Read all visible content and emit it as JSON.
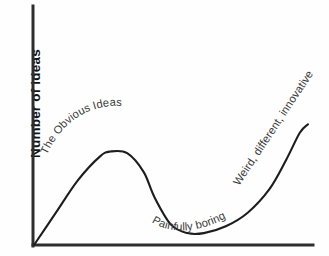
{
  "chart_data": {
    "type": "line",
    "title": "",
    "xlabel": "",
    "ylabel": "Number of Ideas",
    "grid": false,
    "legend_position": "none",
    "axis_style": "open (left and bottom spines only, no ticks, no tick labels)",
    "xlim": [
      0,
      1
    ],
    "ylim": [
      0,
      1
    ],
    "x_tick_labels": [],
    "y_tick_labels": [],
    "series": [
      {
        "name": "Idea quality curve",
        "description": "Rises steeply to an early peak of obvious ideas, collapses into a boring trough, then climbs exponentially into weird, different, innovative territory",
        "x": [
          0.0,
          0.08,
          0.16,
          0.24,
          0.28,
          0.34,
          0.4,
          0.44,
          0.5,
          0.56,
          0.62,
          0.7,
          0.78,
          0.86,
          0.92,
          0.97,
          1.0
        ],
        "y": [
          0.0,
          0.19,
          0.38,
          0.52,
          0.55,
          0.54,
          0.43,
          0.28,
          0.12,
          0.07,
          0.07,
          0.11,
          0.19,
          0.33,
          0.5,
          0.66,
          0.71
        ]
      }
    ],
    "annotations": [
      {
        "id": "peak-label",
        "text": "The Obvious Ideas",
        "placement": "along the outside of the first peak, arcing upward left to right",
        "approx_x": 0.2,
        "approx_y": 0.6
      },
      {
        "id": "trough-label",
        "text": "Painfully boring",
        "placement": "along the bottom of the valley, gently curving",
        "approx_x": 0.52,
        "approx_y": 0.14
      },
      {
        "id": "rise-label",
        "text": "Weird, different, innovative",
        "placement": "along the steep final rise, angled diagonally upward",
        "approx_x": 0.86,
        "approx_y": 0.42
      }
    ]
  },
  "axes": {
    "y_axis_label": "Number of Ideas",
    "x_axis_label": ""
  },
  "colors": {
    "background": "#fefefe",
    "axis": "#2e2e2e",
    "curve": "#1d1d1d",
    "label_text": "#3b3b3b",
    "axis_label_text": "#121212"
  }
}
